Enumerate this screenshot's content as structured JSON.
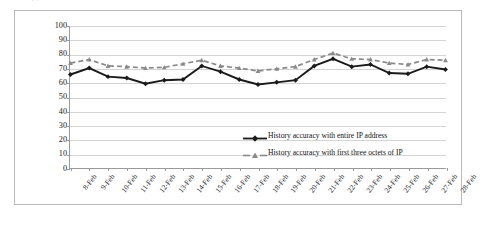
{
  "chart_data": {
    "type": "line",
    "title": "",
    "xlabel": "",
    "ylabel": "History accuracy (%)",
    "ylim": [
      0,
      100
    ],
    "ytick_step": 10,
    "yticks": [
      100,
      90,
      80,
      70,
      60,
      50,
      40,
      30,
      20,
      10,
      0
    ],
    "grid": true,
    "legend_position": "inside-bottom-right",
    "categories": [
      "8-Feb",
      "9-Feb",
      "10-Feb",
      "11-Feb",
      "12-Feb",
      "13-Feb",
      "14-Feb",
      "15-Feb",
      "16-Feb",
      "17-Feb",
      "18-Feb",
      "19-Feb",
      "20-Feb",
      "21-Feb",
      "22-Feb",
      "23-Feb",
      "24-Feb",
      "25-Feb",
      "26-Feb",
      "27-Feb",
      "28-Feb"
    ],
    "series": [
      {
        "name": "History accuracy with entire IP address",
        "marker": "diamond",
        "dash": "solid",
        "color": "#1a1a1a",
        "values": [
          66,
          70.5,
          64.5,
          63.5,
          59.5,
          62,
          62.5,
          72,
          68,
          62.5,
          59,
          60.5,
          62,
          72,
          77,
          71.5,
          73,
          67,
          66.5,
          71.5,
          69.5
        ]
      },
      {
        "name": "History accuracy with first three octets of IP",
        "marker": "triangle",
        "dash": "dashed",
        "color": "#8a8a8a",
        "values": [
          74,
          76.5,
          72,
          71.5,
          70.5,
          71,
          73.5,
          76,
          72,
          70.5,
          68.5,
          70,
          71.5,
          76.5,
          81,
          77,
          76.5,
          74,
          73,
          76.5,
          76
        ]
      }
    ]
  },
  "legend": {
    "items": [
      {
        "label": "History accuracy with entire IP address"
      },
      {
        "label": "History accuracy with first three octets of IP"
      }
    ]
  }
}
